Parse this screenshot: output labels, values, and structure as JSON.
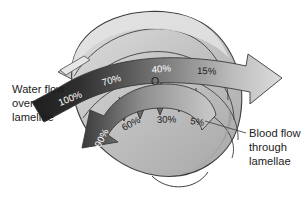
{
  "figure": {
    "background_color": "#ffffff"
  },
  "labels": {
    "water_flow": {
      "line1": "Water flow",
      "line2": "over",
      "line3": "lamellae"
    },
    "blood_flow": {
      "line1": "Blood flow",
      "line2": "through",
      "line3": "lamellae"
    },
    "oxygen": {
      "symbol": "O",
      "subscript": "2"
    }
  },
  "water_flow_arrow": {
    "direction": "left-to-right",
    "description": "Water flows over the lamellae, losing oxygen as it passes",
    "percentages": [
      {
        "value": "100%",
        "text_color": "#ffffff",
        "band_color": "#2a2a2a"
      },
      {
        "value": "70%",
        "text_color": "#ffffff",
        "band_color": "#565656"
      },
      {
        "value": "40%",
        "text_color": "#ffffff",
        "band_color": "#8e8e8e"
      },
      {
        "value": "15%",
        "text_color": "#1c1c1c",
        "band_color": "#cfcfcf"
      }
    ]
  },
  "blood_flow_arrow": {
    "direction": "right-to-left",
    "description": "Blood flows through the lamellae in the opposite direction, gaining oxygen",
    "percentages": [
      {
        "value": "5%",
        "text_color": "#1c1c1c",
        "band_color": "#c6c6c6"
      },
      {
        "value": "30%",
        "text_color": "#1c1c1c",
        "band_color": "#a8a8a8"
      },
      {
        "value": "60%",
        "text_color": "#1c1c1c",
        "band_color": "#8a8a8a"
      },
      {
        "value": "90%",
        "text_color": "#1c1c1c",
        "band_color": "#5a5a5a"
      }
    ]
  },
  "colors": {
    "outline": "#3c3c3c",
    "lamella_light": "#d4d4d4",
    "lamella_mid": "#bcbcbc",
    "lamella_dark": "#a6a6a6",
    "lamella_shadow": "#8f8f8f",
    "text": "#1c1c1c",
    "leader_line": "#4a4a4a"
  },
  "diffusion_arrows": {
    "count": 5,
    "direction": "downward",
    "meaning": "oxygen diffusion from water into blood"
  }
}
